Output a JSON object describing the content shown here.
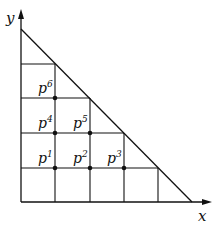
{
  "diagram": {
    "axes": {
      "x_label": "x",
      "y_label": "y"
    },
    "grid": {
      "x_lines": [
        21,
        55,
        90,
        124,
        158
      ],
      "y_lines": [
        64,
        98,
        133,
        168,
        202
      ]
    },
    "hypotenuse": {
      "from": [
        21,
        29
      ],
      "to": [
        192,
        202
      ]
    },
    "points": [
      {
        "name": "p",
        "sup": "1",
        "x": 55,
        "y": 168
      },
      {
        "name": "p",
        "sup": "2",
        "x": 90,
        "y": 168
      },
      {
        "name": "p",
        "sup": "3",
        "x": 124,
        "y": 168
      },
      {
        "name": "p",
        "sup": "4",
        "x": 55,
        "y": 133
      },
      {
        "name": "p",
        "sup": "5",
        "x": 90,
        "y": 133
      },
      {
        "name": "p",
        "sup": "6",
        "x": 55,
        "y": 98
      }
    ],
    "colors": {
      "line": "#111111",
      "background": "#ffffff"
    }
  }
}
